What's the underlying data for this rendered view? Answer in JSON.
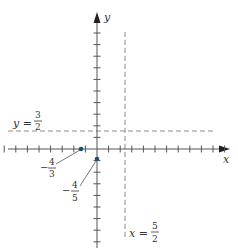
{
  "diagram": {
    "type": "coordinate-plane",
    "axes": {
      "x_label": "x",
      "y_label": "y",
      "origin_px": [
        97,
        149
      ],
      "unit_px": 11.6,
      "x_ticks": [
        -8,
        -7,
        -6,
        -5,
        -4,
        -3,
        -2,
        -1,
        1,
        2,
        3,
        4,
        5,
        6,
        7,
        8,
        9,
        10,
        11
      ],
      "y_ticks": [
        -8,
        -7,
        -6,
        -5,
        -4,
        -3,
        -2,
        -1,
        1,
        2,
        3,
        4,
        5,
        6,
        7,
        8,
        9,
        10
      ]
    },
    "asymptotes": [
      {
        "kind": "horizontal",
        "value": 1.5,
        "label_lhs": "y =",
        "label_num": "3",
        "label_den": "2"
      },
      {
        "kind": "vertical",
        "value": 2.5,
        "label_lhs": "x =",
        "label_num": "5",
        "label_den": "2"
      }
    ],
    "points": [
      {
        "name": "x-intercept",
        "x": -1.3333,
        "y": 0,
        "label_sign": "−",
        "label_num": "4",
        "label_den": "3"
      },
      {
        "name": "y-intercept",
        "x": 0,
        "y": -0.8,
        "label_sign": "−",
        "label_num": "4",
        "label_den": "5"
      }
    ],
    "colors": {
      "axis": "#555555",
      "dashed": "#8a8a8a",
      "point": "#1d4f6e",
      "leader": "#555555",
      "text": "#333333"
    }
  }
}
